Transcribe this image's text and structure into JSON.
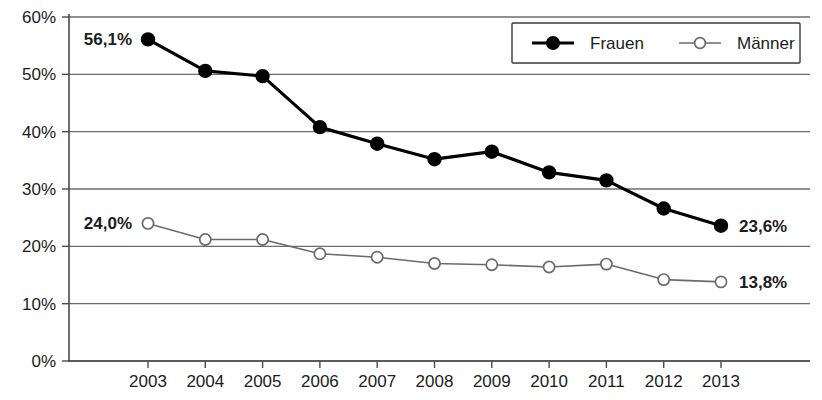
{
  "chart_data": {
    "type": "line",
    "title": "",
    "xlabel": "",
    "ylabel": "",
    "categories": [
      "2003",
      "2004",
      "2005",
      "2006",
      "2007",
      "2008",
      "2009",
      "2010",
      "2011",
      "2012",
      "2013"
    ],
    "ylim": [
      0,
      60
    ],
    "ytick_values": [
      0,
      10,
      20,
      30,
      40,
      50,
      60
    ],
    "ytick_labels": [
      "0%",
      "10%",
      "20%",
      "30%",
      "40%",
      "50%",
      "60%"
    ],
    "grid": true,
    "legend_position": "top-right",
    "series": [
      {
        "name": "Frauen",
        "marker": "filled-circle",
        "color": "#000000",
        "values": [
          56.1,
          50.6,
          49.7,
          40.8,
          37.9,
          35.2,
          36.5,
          32.9,
          31.5,
          26.6,
          23.6
        ]
      },
      {
        "name": "Männer",
        "marker": "open-circle",
        "color": "#6b6b6b",
        "values": [
          24.0,
          21.2,
          21.2,
          18.7,
          18.1,
          17.0,
          16.8,
          16.4,
          16.9,
          14.2,
          13.8
        ]
      }
    ],
    "annotations": [
      {
        "text": "56,1%",
        "series": "Frauen",
        "category": "2003",
        "position": "left"
      },
      {
        "text": "23,6%",
        "series": "Frauen",
        "category": "2013",
        "position": "right"
      },
      {
        "text": "24,0%",
        "series": "Männer",
        "category": "2003",
        "position": "left"
      },
      {
        "text": "13,8%",
        "series": "Männer",
        "category": "2013",
        "position": "right"
      }
    ]
  },
  "legend": {
    "entries": [
      {
        "label": "Frauen",
        "marker": "filled-circle"
      },
      {
        "label": "Männer",
        "marker": "open-circle"
      }
    ]
  }
}
